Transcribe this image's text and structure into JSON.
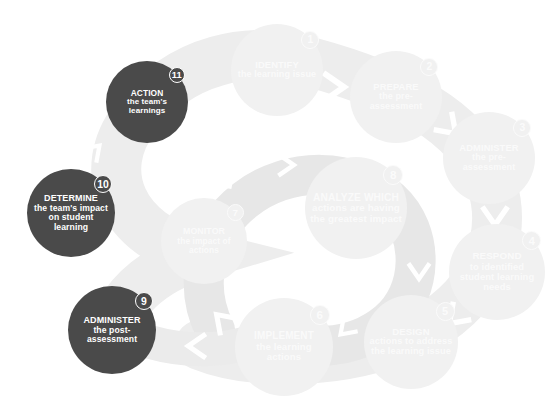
{
  "diagram": {
    "background_color": "#ffffff",
    "band_color": "#ededed",
    "band_color_inner": "#e6e6e6",
    "pale_node_color": "#f1f1f1",
    "dark_node_color": "#4a4a4a",
    "arrow_color": "#ffffff",
    "steps": [
      {
        "number": "1",
        "head": "IDENTIFY",
        "sub": "the learning issue",
        "style": "pale",
        "cx": 277,
        "cy": 70,
        "r": 46
      },
      {
        "number": "2",
        "head": "PREPARE",
        "sub": "the pre-assessment",
        "style": "pale",
        "cx": 396,
        "cy": 97,
        "r": 46
      },
      {
        "number": "3",
        "head": "ADMINISTER",
        "sub": "the pre-assessment",
        "style": "pale",
        "cx": 489,
        "cy": 158,
        "r": 46
      },
      {
        "number": "4",
        "head": "RESPOND",
        "sub": "to identified student learning needs",
        "style": "pale",
        "cx": 497,
        "cy": 272,
        "r": 48
      },
      {
        "number": "5",
        "head": "DESIGN",
        "sub": "actions to address the learning issue",
        "style": "pale",
        "cx": 411,
        "cy": 342,
        "r": 47
      },
      {
        "number": "6",
        "head": "IMPLEMENT",
        "sub": "the learning actions",
        "style": "pale",
        "cx": 284,
        "cy": 347,
        "r": 49
      },
      {
        "number": "7",
        "head": "MONITOR",
        "sub": "the impact of actions",
        "style": "pale",
        "cx": 204,
        "cy": 241,
        "r": 43
      },
      {
        "number": "8",
        "head": "ANALYZE which",
        "sub": "actions are having the greatest impact",
        "style": "pale",
        "cx": 356,
        "cy": 208,
        "r": 51
      },
      {
        "number": "9",
        "head": "ADMINISTER",
        "sub": "the post-assessment",
        "style": "dark",
        "cx": 112,
        "cy": 330,
        "r": 44
      },
      {
        "number": "10",
        "head": "DETERMINE",
        "sub": "the team's impact on student learning",
        "style": "dark",
        "cx": 71,
        "cy": 213,
        "r": 44
      },
      {
        "number": "11",
        "head": "ACTION",
        "sub": "the team's learnings",
        "style": "dark",
        "cx": 147,
        "cy": 102,
        "r": 41
      }
    ],
    "arrows": [
      {
        "name": "arrow-1-to-2",
        "x": 335,
        "y": 87,
        "rot": 0,
        "size": 20,
        "shade": "#ffffff"
      },
      {
        "name": "arrow-2-to-3",
        "x": 450,
        "y": 128,
        "rot": 45,
        "size": 18,
        "shade": "#ffffff"
      },
      {
        "name": "arrow-3-to-4",
        "x": 495,
        "y": 217,
        "rot": 90,
        "size": 18,
        "shade": "#ffffff"
      },
      {
        "name": "arrow-4-to-5",
        "x": 455,
        "y": 318,
        "rot": 135,
        "size": 18,
        "shade": "#ffffff"
      },
      {
        "name": "arrow-6-to-7",
        "x": 222,
        "y": 320,
        "rot": 225,
        "size": 17,
        "shade": "#ffffff"
      },
      {
        "name": "arrow-spiral-lower",
        "x": 196,
        "y": 346,
        "rot": 180,
        "size": 17,
        "shade": "#ffffff"
      },
      {
        "name": "arrow-7-to-8",
        "x": 287,
        "y": 165,
        "rot": 0,
        "size": 15,
        "shade": "#ffffff"
      },
      {
        "name": "arrow-inner-upleft",
        "x": 228,
        "y": 176,
        "rot": 315,
        "size": 14,
        "shade": "#ffffff"
      },
      {
        "name": "arrow-8-to-6",
        "x": 419,
        "y": 272,
        "rot": 90,
        "size": 15,
        "shade": "#ffffff"
      },
      {
        "name": "arrow-inner-lower",
        "x": 345,
        "y": 330,
        "rot": 135,
        "size": 14,
        "shade": "#ffffff"
      },
      {
        "name": "arrow-11-outer",
        "x": 213,
        "y": 151,
        "rot": 315,
        "size": 15,
        "shade": "#ffffff"
      },
      {
        "name": "arrow-10-outer",
        "x": 95,
        "y": 150,
        "rot": 315,
        "size": 14,
        "shade": "#ffffff"
      }
    ]
  }
}
